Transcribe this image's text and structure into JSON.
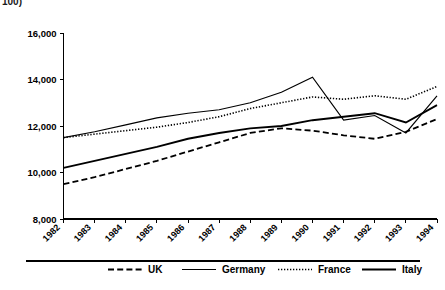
{
  "clipped_text": "100)",
  "chart_data": {
    "type": "line",
    "title": "",
    "subtitle": "",
    "xlabel": "",
    "ylabel": "",
    "x": [
      1982,
      1983,
      1984,
      1985,
      1986,
      1987,
      1988,
      1989,
      1990,
      1991,
      1992,
      1993,
      1994
    ],
    "categories": [
      "1982",
      "1983",
      "1984",
      "1985",
      "1986",
      "1987",
      "1988",
      "1989",
      "1990",
      "1991",
      "1992",
      "1993",
      "1994"
    ],
    "xlim": [
      1982,
      1994
    ],
    "ylim": [
      8000,
      16000
    ],
    "yticks": [
      8000,
      10000,
      12000,
      14000,
      16000
    ],
    "ytick_labels": [
      "8,000",
      "10,000",
      "12,000",
      "14,000",
      "16,000"
    ],
    "grid": false,
    "legend_position": "bottom",
    "series": [
      {
        "name": "UK",
        "style": "dashed",
        "values": [
          9500,
          9800,
          10150,
          10500,
          10900,
          11300,
          11700,
          11900,
          11800,
          11600,
          11450,
          11750,
          12300
        ]
      },
      {
        "name": "Germany",
        "style": "solid-thin",
        "values": [
          11500,
          11750,
          12050,
          12350,
          12550,
          12700,
          13000,
          13450,
          14100,
          12250,
          12450,
          11700,
          13300
        ]
      },
      {
        "name": "France",
        "style": "dotted",
        "values": [
          11500,
          11650,
          11800,
          11950,
          12150,
          12400,
          12750,
          13000,
          13250,
          13150,
          13300,
          13150,
          13700
        ]
      },
      {
        "name": "Italy",
        "style": "solid-thick",
        "values": [
          10200,
          10500,
          10800,
          11100,
          11450,
          11700,
          11900,
          12000,
          12250,
          12400,
          12550,
          12150,
          12900
        ]
      }
    ]
  },
  "legend": {
    "items": [
      {
        "label": "UK",
        "style": "dashed"
      },
      {
        "label": "Germany",
        "style": "solid-thin"
      },
      {
        "label": "France",
        "style": "dotted"
      },
      {
        "label": "Italy",
        "style": "solid-thick"
      }
    ]
  },
  "colors": {
    "ink": "#000000",
    "background": "#ffffff"
  }
}
